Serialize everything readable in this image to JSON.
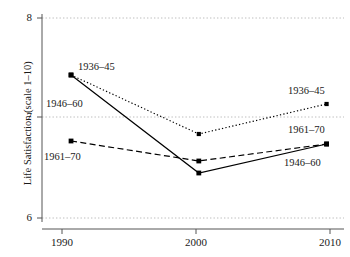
{
  "chart_data": {
    "type": "line",
    "title": "",
    "xlabel": "",
    "ylabel": "Life Satisfaction (scale 1–10)",
    "x": [
      1990,
      2001,
      2012
    ],
    "xticks": [
      1990,
      2000,
      2010
    ],
    "xtick_labels": [
      "1990",
      "2000",
      "2010"
    ],
    "yticks": [
      6,
      7,
      8
    ],
    "ytick_labels": [
      "6",
      "7",
      "8"
    ],
    "ylim": [
      6,
      8
    ],
    "xlim": [
      1987.5,
      2013.5
    ],
    "grid": "horizontal-dotted",
    "legend": "inline-annotations",
    "series": [
      {
        "name": "1936–45",
        "style": "dotted",
        "marker": "square",
        "values": [
          7.43,
          6.84,
          7.14
        ]
      },
      {
        "name": "1946–60",
        "style": "solid",
        "marker": "square",
        "values": [
          7.43,
          6.45,
          6.74
        ]
      },
      {
        "name": "1961–70",
        "style": "dashed",
        "marker": "square",
        "values": [
          6.77,
          6.57,
          6.74
        ]
      }
    ],
    "annotations": [
      {
        "text": "1936–45",
        "series": "1936–45",
        "position": "upper-left"
      },
      {
        "text": "1946–60",
        "series": "1946–60",
        "position": "mid-left"
      },
      {
        "text": "1961–70",
        "series": "1961–70",
        "position": "lower-left"
      },
      {
        "text": "1936–45",
        "series": "1936–45",
        "position": "upper-right"
      },
      {
        "text": "1961–70",
        "series": "1961–70",
        "position": "mid-right"
      },
      {
        "text": "1946–60",
        "series": "1946–60",
        "position": "lower-right"
      }
    ],
    "colors": {
      "line": "#000000",
      "grid": "#b8b8b8",
      "axis": "#4a4a4a",
      "text": "#1a1a1a",
      "background": "#ffffff"
    }
  },
  "axis": {
    "y_title": "Life Satisfaction (scale 1–10)",
    "y_ticks": [
      {
        "label": "8"
      },
      {
        "label": "7"
      },
      {
        "label": "6"
      }
    ],
    "x_ticks": [
      {
        "label": "1990"
      },
      {
        "label": "2000"
      },
      {
        "label": "2010"
      }
    ]
  },
  "annotations": {
    "left_top": "1936–45",
    "left_mid": "1946–60",
    "left_bottom": "1961–70",
    "right_top": "1936–45",
    "right_mid": "1961–70",
    "right_bottom": "1946–60"
  }
}
